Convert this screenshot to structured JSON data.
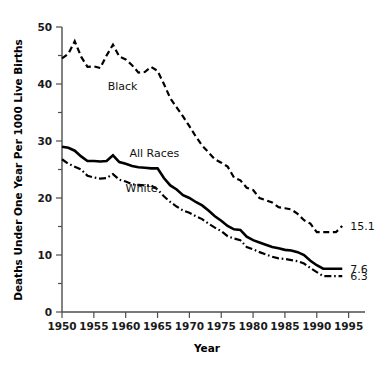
{
  "chart_data": {
    "type": "line",
    "title": "",
    "xlabel": "Year",
    "ylabel": "Deaths Under One Year Per 1000 Live Births",
    "xlim": [
      1950,
      1996
    ],
    "ylim": [
      0,
      50
    ],
    "xticks": [
      1950,
      1955,
      1960,
      1965,
      1970,
      1975,
      1980,
      1985,
      1990,
      1995
    ],
    "xtick_labels": [
      "1950",
      "1955",
      "1960",
      "1965",
      "1970",
      "1975",
      "1980",
      "1985",
      "1990",
      "1995"
    ],
    "yticks": [
      0,
      10,
      20,
      30,
      40,
      50
    ],
    "ytick_labels": [
      "0",
      "10",
      "20",
      "30",
      "40",
      "50"
    ],
    "y_minor_ticks": [
      5,
      15,
      25,
      35,
      45
    ],
    "grid": false,
    "legend_position": "inline-annotations",
    "series": [
      {
        "name": "Black",
        "style": "dashed",
        "label": "Black",
        "label_x": 1959.5,
        "label_y": 39.0,
        "end_label": "15.1",
        "x": [
          1950,
          1951,
          1952,
          1953,
          1954,
          1955,
          1956,
          1957,
          1958,
          1959,
          1960,
          1961,
          1962,
          1963,
          1964,
          1965,
          1966,
          1967,
          1968,
          1969,
          1970,
          1971,
          1972,
          1973,
          1974,
          1975,
          1976,
          1977,
          1978,
          1979,
          1980,
          1981,
          1982,
          1983,
          1984,
          1985,
          1986,
          1987,
          1988,
          1989,
          1990,
          1991,
          1992,
          1993,
          1994
        ],
        "y": [
          44.5,
          45.3,
          47.5,
          44.8,
          43.0,
          43.1,
          42.8,
          45.0,
          46.9,
          44.8,
          44.3,
          43.3,
          42.0,
          42.1,
          43.0,
          42.3,
          40.0,
          37.5,
          35.9,
          34.3,
          32.6,
          30.8,
          29.2,
          28.0,
          26.8,
          26.2,
          25.5,
          23.6,
          23.1,
          21.8,
          21.4,
          20.0,
          19.6,
          19.2,
          18.4,
          18.2,
          18.0,
          17.2,
          16.1,
          15.5,
          14.0,
          14.0,
          14.0,
          14.0,
          15.1
        ]
      },
      {
        "name": "All Races",
        "style": "solid",
        "label": "All Races",
        "label_x": 1964.5,
        "label_y": 27.2,
        "end_label": "7.6",
        "x": [
          1950,
          1951,
          1952,
          1953,
          1954,
          1955,
          1956,
          1957,
          1958,
          1959,
          1960,
          1961,
          1962,
          1963,
          1964,
          1965,
          1966,
          1967,
          1968,
          1969,
          1970,
          1971,
          1972,
          1973,
          1974,
          1975,
          1976,
          1977,
          1978,
          1979,
          1980,
          1981,
          1982,
          1983,
          1984,
          1985,
          1986,
          1987,
          1988,
          1989,
          1990,
          1991,
          1992,
          1993,
          1994
        ],
        "y": [
          29.0,
          28.8,
          28.3,
          27.3,
          26.5,
          26.5,
          26.4,
          26.5,
          27.5,
          26.3,
          26.0,
          25.6,
          25.4,
          25.3,
          25.2,
          25.2,
          23.5,
          22.2,
          21.5,
          20.5,
          20.0,
          19.3,
          18.7,
          17.8,
          16.8,
          16.0,
          15.1,
          14.5,
          14.4,
          13.2,
          12.6,
          12.2,
          11.8,
          11.4,
          11.2,
          10.9,
          10.8,
          10.5,
          10.0,
          9.0,
          8.2,
          7.6,
          7.6,
          7.6,
          7.6
        ]
      },
      {
        "name": "White",
        "style": "dash-dot",
        "label": "White",
        "label_x": 1962.5,
        "label_y": 21.0,
        "end_label": "6.3",
        "x": [
          1950,
          1951,
          1952,
          1953,
          1954,
          1955,
          1956,
          1957,
          1958,
          1959,
          1960,
          1961,
          1962,
          1963,
          1964,
          1965,
          1966,
          1967,
          1968,
          1969,
          1970,
          1971,
          1972,
          1973,
          1974,
          1975,
          1976,
          1977,
          1978,
          1979,
          1980,
          1981,
          1982,
          1983,
          1984,
          1985,
          1986,
          1987,
          1988,
          1989,
          1990,
          1991,
          1992,
          1993,
          1994
        ],
        "y": [
          26.8,
          26.0,
          25.5,
          25.0,
          23.9,
          23.6,
          23.4,
          23.5,
          24.2,
          23.2,
          22.9,
          22.4,
          22.3,
          22.2,
          22.2,
          21.5,
          20.3,
          19.3,
          18.5,
          17.8,
          17.4,
          16.8,
          16.3,
          15.5,
          14.8,
          14.2,
          13.3,
          12.9,
          12.6,
          11.4,
          11.0,
          10.5,
          10.1,
          9.7,
          9.4,
          9.3,
          9.1,
          8.9,
          8.5,
          7.7,
          7.0,
          6.3,
          6.3,
          6.3,
          6.3
        ]
      }
    ]
  },
  "axes": {
    "y_title": "Deaths Under One Year Per 1000 Live Births",
    "x_title": "Year"
  }
}
